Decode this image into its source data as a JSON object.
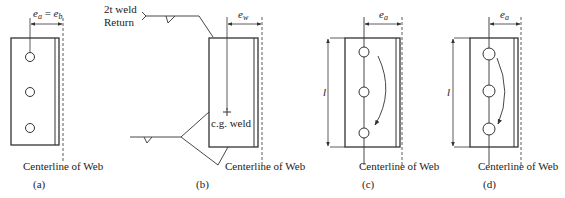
{
  "figure": {
    "panels": [
      {
        "id": "a",
        "caption": "(a)",
        "dimension_label": "e_a = e_b",
        "dimension_text_left": "e",
        "dimension_sub_left": "a",
        "dimension_eq": " = ",
        "dimension_text_right": "e",
        "dimension_sub_right": "b",
        "centerline_label": "Centerline of Web",
        "bolt_count": 3
      },
      {
        "id": "b",
        "caption": "(b)",
        "dimension_text": "e",
        "dimension_sub": "w",
        "weld_label_line1": "2t weld",
        "weld_label_line2": "Return",
        "cg_label": "c.g. weld",
        "centerline_label": "Centerline of Web"
      },
      {
        "id": "c",
        "caption": "(c)",
        "dimension_text": "e",
        "dimension_sub": "a",
        "length_label": "l",
        "centerline_label": "Centerline of Web",
        "bolt_count": 3
      },
      {
        "id": "d",
        "caption": "(d)",
        "dimension_text": "e",
        "dimension_sub": "a",
        "length_label": "l",
        "centerline_label": "Centerline of Web",
        "bolt_count": 3
      }
    ],
    "colors": {
      "line": "#333333",
      "text": "#222222",
      "background": "#ffffff"
    }
  }
}
